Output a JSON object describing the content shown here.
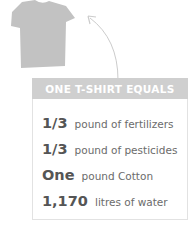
{
  "illustration": {
    "icon": "tshirt-icon",
    "arrow": "curved-arrow-icon",
    "color": "#c2c2c2"
  },
  "header": {
    "title": "ONE T-SHIRT EQUALS",
    "background": "#cfcfcf"
  },
  "facts": [
    {
      "amount": "1/3",
      "description": "pound of fertilizers"
    },
    {
      "amount": "1/3",
      "description": "pound of pesticides"
    },
    {
      "amount": "One",
      "description": "pound Cotton"
    },
    {
      "amount": "1,170",
      "description": "litres of water"
    }
  ]
}
